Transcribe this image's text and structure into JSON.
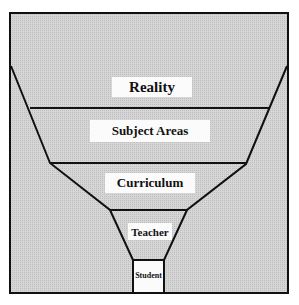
{
  "diagram": {
    "type": "funnel",
    "levels": [
      {
        "label": "Reality"
      },
      {
        "label": "Subject Areas"
      },
      {
        "label": "Curriculum"
      },
      {
        "label": "Teacher"
      },
      {
        "label": "Student"
      }
    ],
    "colors": {
      "background": "#d2d2d2",
      "line": "#111111",
      "label_bg": "#fbfbfb"
    }
  }
}
